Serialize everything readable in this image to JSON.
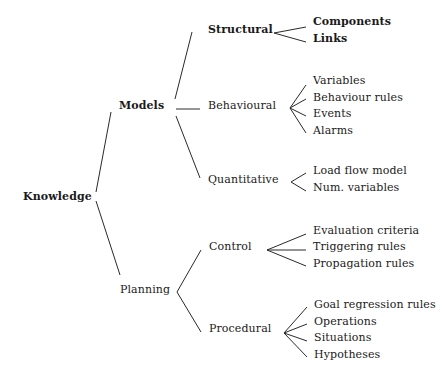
{
  "diagram": {
    "type": "tree",
    "orientation": "left-to-right",
    "root": {
      "label": "Knowledge",
      "children": [
        {
          "label": "Models",
          "children": [
            {
              "label": "Structural",
              "children": [
                {
                  "label": "Components"
                },
                {
                  "label": "Links"
                }
              ]
            },
            {
              "label": "Behavioural",
              "children": [
                {
                  "label": "Variables"
                },
                {
                  "label": "Behaviour rules"
                },
                {
                  "label": "Events"
                },
                {
                  "label": "Alarms"
                }
              ]
            },
            {
              "label": "Quantitative",
              "children": [
                {
                  "label": "Load flow model"
                },
                {
                  "label": "Num. variables"
                }
              ]
            }
          ]
        },
        {
          "label": "Planning",
          "children": [
            {
              "label": "Control",
              "children": [
                {
                  "label": "Evaluation criteria"
                },
                {
                  "label": "Triggering rules"
                },
                {
                  "label": "Propagation rules"
                }
              ]
            },
            {
              "label": "Procedural",
              "children": [
                {
                  "label": "Goal regression rules"
                },
                {
                  "label": "Operations"
                },
                {
                  "label": "Situations"
                },
                {
                  "label": "Hypotheses"
                }
              ]
            }
          ]
        }
      ]
    }
  },
  "labels": {
    "knowledge": "Knowledge",
    "models": "Models",
    "planning": "Planning",
    "structural": "Structural",
    "behavioural": "Behavioural",
    "quantitative": "Quantitative",
    "control": "Control",
    "procedural": "Procedural",
    "components": "Components",
    "links": "Links",
    "variables": "Variables",
    "behaviour_rules": "Behaviour rules",
    "events": "Events",
    "alarms": "Alarms",
    "load_flow_model": "Load flow model",
    "num_variables": "Num. variables",
    "evaluation_criteria": "Evaluation criteria",
    "triggering_rules": "Triggering rules",
    "propagation_rules": "Propagation rules",
    "goal_regression_rules": "Goal regression rules",
    "operations": "Operations",
    "situations": "Situations",
    "hypotheses": "Hypotheses"
  },
  "colors": {
    "background": "#ffffff",
    "text": "#1a1a1a",
    "lines": "#2a2a2a"
  }
}
